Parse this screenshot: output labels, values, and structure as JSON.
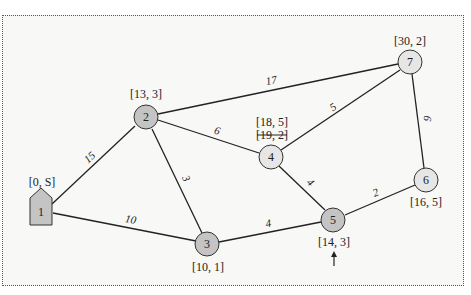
{
  "diagram": {
    "type": "weighted-graph",
    "nodes": [
      {
        "id": "1",
        "label": "1",
        "tag": "[0, S]",
        "shape": "house",
        "fill": "#c4c4c4"
      },
      {
        "id": "2",
        "label": "2",
        "tag": "[13, 3]",
        "shape": "circle",
        "fill": "#c4c4c4"
      },
      {
        "id": "3",
        "label": "3",
        "tag": "[10, 1]",
        "shape": "circle",
        "fill": "#c4c4c4"
      },
      {
        "id": "4",
        "label": "4",
        "tag": "[18, 5]",
        "tag_struck": "[19, 2]",
        "shape": "circle",
        "fill": "#e6e6e6"
      },
      {
        "id": "5",
        "label": "5",
        "tag": "[14, 3]",
        "shape": "circle",
        "fill": "#c4c4c4",
        "marker": "up-arrow"
      },
      {
        "id": "6",
        "label": "6",
        "tag": "[16, 5]",
        "shape": "circle",
        "fill": "#e6e6e6"
      },
      {
        "id": "7",
        "label": "7",
        "tag": "[30, 2]",
        "shape": "circle",
        "fill": "#e6e6e6"
      }
    ],
    "edges": [
      {
        "from": "1",
        "to": "2",
        "weight": "15"
      },
      {
        "from": "1",
        "to": "3",
        "weight": "10"
      },
      {
        "from": "2",
        "to": "3",
        "weight": "3"
      },
      {
        "from": "2",
        "to": "4",
        "weight": "6"
      },
      {
        "from": "2",
        "to": "7",
        "weight": "17"
      },
      {
        "from": "3",
        "to": "5",
        "weight": "4"
      },
      {
        "from": "4",
        "to": "5",
        "weight": "4"
      },
      {
        "from": "4",
        "to": "7",
        "weight": "5"
      },
      {
        "from": "5",
        "to": "6",
        "weight": "2"
      },
      {
        "from": "6",
        "to": "7",
        "weight": "6"
      }
    ]
  }
}
